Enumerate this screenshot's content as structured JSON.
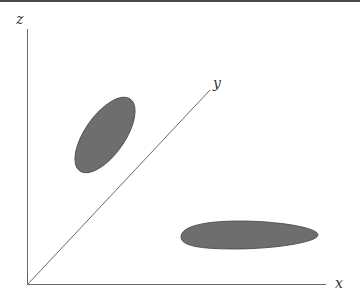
{
  "diagram": {
    "type": "3d-axes-sketch",
    "axes": {
      "x": {
        "label": "x"
      },
      "y": {
        "label": "y"
      },
      "z": {
        "label": "z"
      }
    },
    "shapes": [
      {
        "name": "upper-left-ellipse",
        "description": "tilted ellipse above the y axis, left of it"
      },
      {
        "name": "lower-right-ellipse",
        "description": "elongated egg-shaped blob near the x axis"
      }
    ],
    "colors": {
      "axis": "#6a6a6a",
      "shape_fill": "#6e6e6e",
      "shape_stroke": "#444444",
      "label": "#333333",
      "top_border": "#4a4a4a"
    }
  }
}
